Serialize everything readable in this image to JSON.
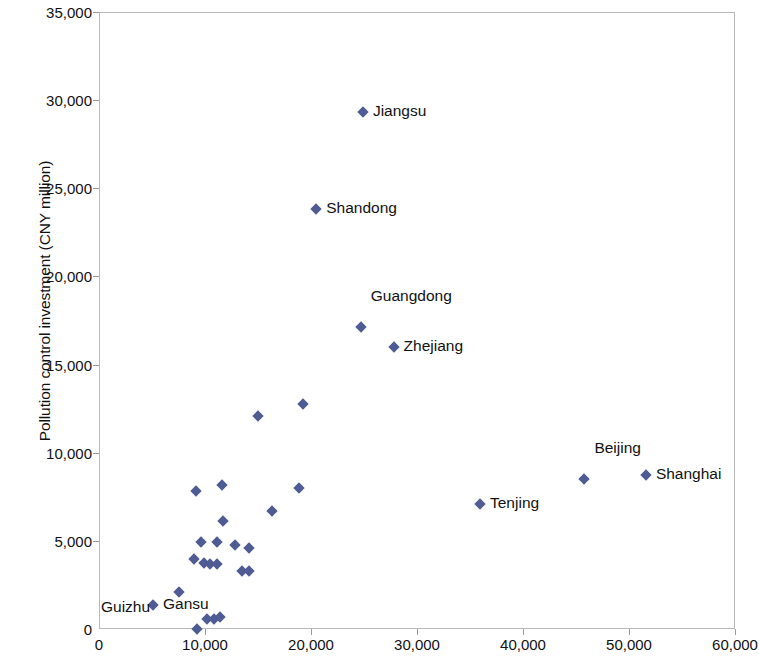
{
  "chart_data": {
    "type": "scatter",
    "title": "",
    "xlabel": "Per capita GDP (CNY)",
    "ylabel": "Pollution control investment (CNY million)",
    "xlim": [
      0,
      60000
    ],
    "ylim": [
      0,
      35000
    ],
    "xticks": [
      0,
      10000,
      20000,
      30000,
      40000,
      50000,
      60000
    ],
    "yticks": [
      0,
      5000,
      10000,
      15000,
      20000,
      25000,
      30000,
      35000
    ],
    "xtick_labels": [
      "0",
      "10,000",
      "20,000",
      "30,000",
      "40,000",
      "50,000",
      "60,000"
    ],
    "ytick_labels": [
      "0",
      "5,000",
      "10,000",
      "15,000",
      "20,000",
      "25,000",
      "30,000",
      "35,000"
    ],
    "grid": false,
    "legend": "none",
    "marker_color": "#4f5b93",
    "marker_shape": "diamond",
    "points": [
      {
        "x": 24800,
        "y": 29380,
        "label": "Jiangsu"
      },
      {
        "x": 20400,
        "y": 23900,
        "label": "Shandong"
      },
      {
        "x": 24600,
        "y": 17200,
        "label": "Guangdong"
      },
      {
        "x": 27700,
        "y": 16050,
        "label": "Zhejiang"
      },
      {
        "x": 45700,
        "y": 8570,
        "label": "Beijing"
      },
      {
        "x": 51500,
        "y": 8790,
        "label": "Shanghai"
      },
      {
        "x": 35850,
        "y": 7150,
        "label": "Tenjing"
      },
      {
        "x": 7450,
        "y": 2150,
        "label": "Guizhu"
      },
      {
        "x": 5000,
        "y": 1420,
        "label": "Gansu"
      },
      {
        "x": 14950,
        "y": 12150,
        "label": ""
      },
      {
        "x": 19150,
        "y": 12820,
        "label": ""
      },
      {
        "x": 11500,
        "y": 8250,
        "label": ""
      },
      {
        "x": 9050,
        "y": 7880,
        "label": ""
      },
      {
        "x": 18750,
        "y": 8060,
        "label": ""
      },
      {
        "x": 16200,
        "y": 6750,
        "label": ""
      },
      {
        "x": 11600,
        "y": 6180,
        "label": ""
      },
      {
        "x": 14100,
        "y": 4650,
        "label": ""
      },
      {
        "x": 9550,
        "y": 5000,
        "label": ""
      },
      {
        "x": 11050,
        "y": 5000,
        "label": ""
      },
      {
        "x": 12750,
        "y": 4820,
        "label": ""
      },
      {
        "x": 8850,
        "y": 4020,
        "label": ""
      },
      {
        "x": 9800,
        "y": 3780,
        "label": ""
      },
      {
        "x": 10400,
        "y": 3740,
        "label": ""
      },
      {
        "x": 11050,
        "y": 3740,
        "label": ""
      },
      {
        "x": 13400,
        "y": 3350,
        "label": ""
      },
      {
        "x": 14050,
        "y": 3350,
        "label": ""
      },
      {
        "x": 10100,
        "y": 620,
        "label": ""
      },
      {
        "x": 10750,
        "y": 620,
        "label": ""
      },
      {
        "x": 11300,
        "y": 730,
        "label": ""
      },
      {
        "x": 9150,
        "y": 60,
        "label": ""
      }
    ],
    "annotations": [
      {
        "text": "Jiangsu",
        "x": 24800,
        "y": 29380,
        "position": "right"
      },
      {
        "text": "Shandong",
        "x": 20400,
        "y": 23900,
        "position": "right"
      },
      {
        "text": "Guangdong",
        "x": 24600,
        "y": 17200,
        "position": "above-right"
      },
      {
        "text": "Zhejiang",
        "x": 27700,
        "y": 16050,
        "position": "right"
      },
      {
        "text": "Beijing",
        "x": 45700,
        "y": 8570,
        "position": "above-right"
      },
      {
        "text": "Shanghai",
        "x": 51500,
        "y": 8790,
        "position": "right"
      },
      {
        "text": "Tenjing",
        "x": 35850,
        "y": 7150,
        "position": "right"
      },
      {
        "text": "Guizhu",
        "x": 7450,
        "y": 2150,
        "position": "left"
      },
      {
        "text": "Gansu",
        "x": 5000,
        "y": 1420,
        "position": "right"
      }
    ]
  }
}
